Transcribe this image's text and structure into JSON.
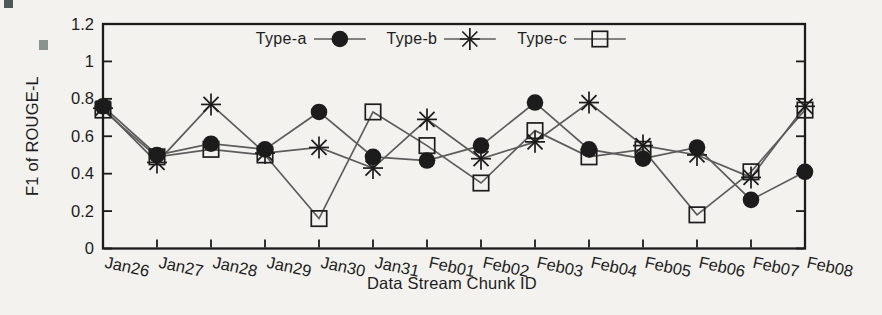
{
  "figure": {
    "background_color": "#f3f2ef",
    "axis_color": "#1b1b1b",
    "line_color": "#5c5c5c",
    "marker_color": "#1c1c1c",
    "text_color": "#1d1d1d"
  },
  "scan_artifacts": [
    {
      "x": 4,
      "y": 0,
      "w": 9,
      "h": 8,
      "color": "#4e5a55"
    },
    {
      "x": 39,
      "y": 40,
      "w": 9,
      "h": 10,
      "color": "#8a948f"
    }
  ],
  "chart_data": {
    "type": "line",
    "title": "",
    "xlabel": "Data Stream Chunk ID",
    "ylabel": "F1 of ROUGE-L",
    "grid": false,
    "legend_position": "top-center-inside",
    "ylim": [
      0,
      1.2
    ],
    "yticks": [
      0,
      0.2,
      0.4,
      0.6,
      0.8,
      1,
      1.2
    ],
    "ytick_labels": [
      "0",
      "0.2",
      "0.4",
      "0.6",
      "0.8",
      "1",
      "1.2"
    ],
    "categories": [
      "Jan26",
      "Jan27",
      "Jan28",
      "Jan29",
      "Jan30",
      "Jan31",
      "Feb01",
      "Feb02",
      "Feb03",
      "Feb04",
      "Feb05",
      "Feb06",
      "Feb07",
      "Feb08"
    ],
    "series": [
      {
        "name": "Type-a",
        "marker": "filled-circle",
        "values": [
          0.76,
          0.5,
          0.56,
          0.53,
          0.73,
          0.49,
          0.47,
          0.55,
          0.78,
          0.53,
          0.48,
          0.54,
          0.26,
          0.41
        ]
      },
      {
        "name": "Type-b",
        "marker": "asterisk",
        "values": [
          0.75,
          0.46,
          0.77,
          0.51,
          0.54,
          0.43,
          0.69,
          0.48,
          0.57,
          0.78,
          0.55,
          0.5,
          0.38,
          0.76
        ]
      },
      {
        "name": "Type-c",
        "marker": "open-square",
        "values": [
          0.74,
          0.49,
          0.53,
          0.5,
          0.16,
          0.73,
          0.55,
          0.35,
          0.63,
          0.49,
          0.53,
          0.18,
          0.41,
          0.74
        ]
      }
    ]
  }
}
